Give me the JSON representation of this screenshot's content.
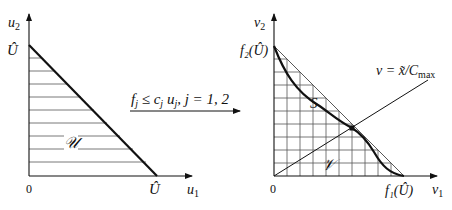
{
  "left_plot": {
    "y_axis_label": "u",
    "y_axis_sub": "2",
    "x_axis_label": "u",
    "x_axis_sub": "1",
    "y_intercept_label": "Û",
    "x_intercept_label": "Û",
    "origin_label": "0",
    "region_label": "𝒰"
  },
  "mapping": {
    "label": "f_j ≤ c_j u_j, j = 1, 2",
    "label_parts": {
      "f": "f",
      "f_sub": "j",
      "leq": " ≤ ",
      "c": "c",
      "c_sub": "j",
      "u": " u",
      "u_sub": "j",
      "rest": ", j = 1, 2"
    }
  },
  "right_plot": {
    "y_axis_label": "v",
    "y_axis_sub": "2",
    "x_axis_label": "v",
    "x_axis_sub": "1",
    "y_intercept_label": "f₂(Û)",
    "x_intercept_label": "f₁(Û)",
    "origin_label": "0",
    "curve_label": "S",
    "region_label": "𝒱",
    "ray_label": "v = x̃/C",
    "ray_label_sub": "max"
  }
}
